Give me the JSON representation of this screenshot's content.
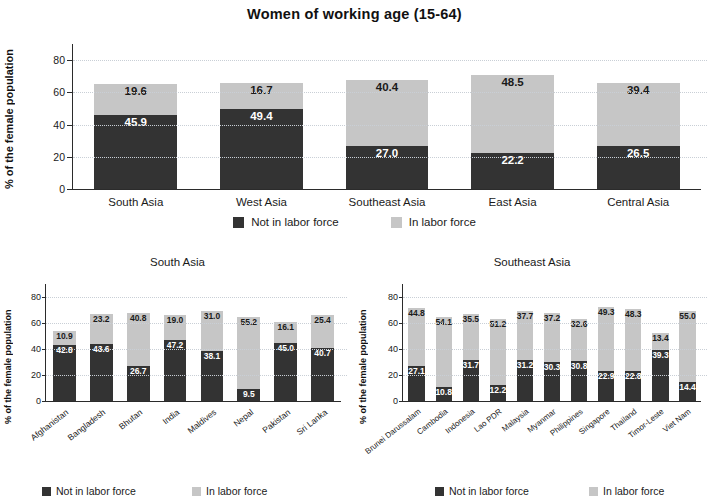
{
  "figure": {
    "title": "Women of working age (15-64)",
    "ylabel": "% of the female population",
    "legend": {
      "not_in_labor_force": "Not in labor force",
      "in_labor_force": "In labor force"
    },
    "colors": {
      "not_in_labor_force": "#333333",
      "in_labor_force": "#c6c6c6",
      "axis": "#2b2b2b",
      "grid": "#c9cfd6"
    }
  },
  "chart_data": [
    {
      "id": "regions",
      "type": "bar",
      "stacked": true,
      "title": "Women of working age (15-64)",
      "xlabel": "",
      "ylabel": "% of the female population",
      "ylim": [
        0,
        90
      ],
      "yticks": [
        0,
        20,
        40,
        60,
        80
      ],
      "ytick_labels": [
        "0",
        "20",
        "40",
        "60",
        "80"
      ],
      "grid": true,
      "legend_position": "bottom",
      "categories": [
        "South Asia",
        "West Asia",
        "Southeast Asia",
        "East Asia",
        "Central Asia"
      ],
      "series": [
        {
          "name": "Not in labor force",
          "color": "#333333",
          "values": [
            45.9,
            49.4,
            27.0,
            22.2,
            26.5
          ]
        },
        {
          "name": "In labor force",
          "color": "#c6c6c6",
          "values": [
            19.6,
            16.7,
            40.4,
            48.5,
            39.4
          ]
        }
      ],
      "bars": [
        {
          "category": "South Asia",
          "dark": 45.9,
          "light": 19.6,
          "dark_first": true
        },
        {
          "category": "West Asia",
          "dark": 49.4,
          "light": 16.7,
          "dark_first": true
        },
        {
          "category": "Southeast Asia",
          "dark": 27.0,
          "light": 40.4,
          "dark_first": true
        },
        {
          "category": "East Asia",
          "dark": 22.2,
          "light": 48.5,
          "dark_first": true
        },
        {
          "category": "Central Asia",
          "dark": 26.5,
          "light": 39.4,
          "dark_first": true
        }
      ]
    },
    {
      "id": "south-asia",
      "type": "bar",
      "stacked": true,
      "title": "South Asia",
      "xlabel": "",
      "ylabel": "% of the female population",
      "ylim": [
        0,
        90
      ],
      "yticks": [
        0,
        20,
        40,
        60,
        80
      ],
      "ytick_labels": [
        "0",
        "20",
        "40",
        "60",
        "80"
      ],
      "grid": true,
      "legend_position": "bottom",
      "categories": [
        "Afghanistan",
        "Bangladesh",
        "Bhutan",
        "India",
        "Maldives",
        "Nepal",
        "Pakistan",
        "Sri Lanka"
      ],
      "series": [
        {
          "name": "Not in labor force",
          "color": "#333333",
          "values": [
            42.8,
            43.6,
            26.7,
            47.2,
            38.1,
            9.5,
            45.0,
            40.7
          ]
        },
        {
          "name": "In labor force",
          "color": "#c6c6c6",
          "values": [
            10.9,
            23.2,
            40.8,
            19.0,
            31.0,
            55.2,
            16.1,
            25.4
          ]
        }
      ],
      "bars": [
        {
          "category": "Afghanistan",
          "dark": 42.8,
          "light": 10.9,
          "dark_first": true
        },
        {
          "category": "Bangladesh",
          "dark": 43.6,
          "light": 23.2,
          "dark_first": true
        },
        {
          "category": "Bhutan",
          "dark": 26.7,
          "light": 40.8,
          "dark_first": true
        },
        {
          "category": "India",
          "dark": 47.2,
          "light": 19.0,
          "dark_first": true
        },
        {
          "category": "Maldives",
          "dark": 38.1,
          "light": 31.0,
          "dark_first": true
        },
        {
          "category": "Nepal",
          "dark": 9.5,
          "light": 55.2,
          "dark_first": true
        },
        {
          "category": "Pakistan",
          "dark": 45.0,
          "light": 16.1,
          "dark_first": true
        },
        {
          "category": "Sri Lanka",
          "dark": 40.7,
          "light": 25.4,
          "dark_first": true
        }
      ]
    },
    {
      "id": "southeast-asia",
      "type": "bar",
      "stacked": true,
      "title": "Southeast Asia",
      "xlabel": "",
      "ylabel": "% of the female population",
      "ylim": [
        0,
        90
      ],
      "yticks": [
        0,
        20,
        40,
        60,
        80
      ],
      "ytick_labels": [
        "0",
        "20",
        "40",
        "60",
        "80"
      ],
      "grid": true,
      "legend_position": "bottom",
      "categories": [
        "Brunei Darussalam",
        "Cambodia",
        "Indonesia",
        "Lao PDR",
        "Malaysia",
        "Myanmar",
        "Philippines",
        "Singapore",
        "Thailand",
        "Timor-Leste",
        "Viet Nam"
      ],
      "series": [
        {
          "name": "Not in labor force",
          "color": "#333333",
          "values": [
            27.1,
            10.8,
            31.7,
            12.2,
            31.2,
            30.3,
            30.8,
            22.9,
            22.8,
            39.3,
            14.4
          ]
        },
        {
          "name": "In labor force",
          "color": "#c6c6c6",
          "values": [
            44.8,
            54.1,
            35.5,
            51.2,
            37.7,
            37.2,
            32.6,
            49.3,
            48.3,
            13.4,
            55.0
          ]
        }
      ],
      "bars": [
        {
          "category": "Brunei Darussalam",
          "dark": 27.1,
          "light": 44.8,
          "dark_first": true
        },
        {
          "category": "Cambodia",
          "dark": 10.8,
          "light": 54.1,
          "dark_first": true
        },
        {
          "category": "Indonesia",
          "dark": 31.7,
          "light": 35.5,
          "dark_first": true
        },
        {
          "category": "Lao PDR",
          "dark": 12.2,
          "light": 51.2,
          "dark_first": true
        },
        {
          "category": "Malaysia",
          "dark": 31.2,
          "light": 37.7,
          "dark_first": true
        },
        {
          "category": "Myanmar",
          "dark": 30.3,
          "light": 37.2,
          "dark_first": true
        },
        {
          "category": "Philippines",
          "dark": 30.8,
          "light": 32.6,
          "dark_first": true
        },
        {
          "category": "Singapore",
          "dark": 22.9,
          "light": 49.3,
          "dark_first": true
        },
        {
          "category": "Thailand",
          "dark": 22.8,
          "light": 48.3,
          "dark_first": true
        },
        {
          "category": "Timor-Leste",
          "dark": 39.3,
          "light": 13.4,
          "dark_first": true
        },
        {
          "category": "Viet Nam",
          "dark": 14.4,
          "light": 55.0,
          "dark_first": true
        }
      ]
    }
  ]
}
